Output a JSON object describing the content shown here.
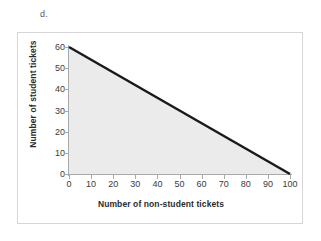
{
  "item_label": "d.",
  "chart_data": {
    "type": "area",
    "title": "",
    "xlabel": "Number of non-student tickets",
    "ylabel": "Number of student tickets",
    "xlim": [
      0,
      100
    ],
    "ylim": [
      0,
      60
    ],
    "xticks": [
      0,
      10,
      20,
      30,
      40,
      50,
      60,
      70,
      80,
      90,
      100
    ],
    "yticks": [
      0,
      10,
      20,
      30,
      40,
      50,
      60
    ],
    "xtick_labels": [
      "0",
      "10",
      "20",
      "30",
      "40",
      "50",
      "60",
      "70",
      "80",
      "90",
      "100"
    ],
    "ytick_labels": [
      "0",
      "10",
      "20",
      "30",
      "40",
      "50",
      "60"
    ],
    "grid": false,
    "legend": null,
    "series": [
      {
        "name": "constraint-boundary",
        "x": [
          0,
          100
        ],
        "values": [
          60,
          0
        ],
        "line_color": "#1a1a1a",
        "line_width": 2.5,
        "fill": true,
        "fill_color": "#ebebeb",
        "fill_to": 0
      }
    ],
    "annotations": []
  },
  "colors": {
    "line": "#1a1a1a",
    "fill": "#ebebeb",
    "axis": "#a9a9a9",
    "frame": "#d6d6d6",
    "tick_text": "#3a3a3a",
    "title_text": "#2b2b2b"
  }
}
